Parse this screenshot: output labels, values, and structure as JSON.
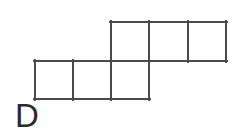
{
  "figure": {
    "label": "D",
    "type": "polyomino-net",
    "background_color": "#ffffff",
    "stroke_color": "#4a4a4a",
    "fill_color": "#ffffff",
    "stroke_width": 2,
    "cell_size": 38,
    "rows": [
      {
        "name": "top-row",
        "y_top": 22,
        "y_bottom": 61,
        "x_start": 111,
        "cells": [
          {
            "name": "cell-top-1",
            "x": 111,
            "y": 22,
            "w": 38,
            "h": 39
          },
          {
            "name": "cell-top-2",
            "x": 149,
            "y": 22,
            "w": 39,
            "h": 39
          },
          {
            "name": "cell-top-3",
            "x": 188,
            "y": 22,
            "w": 38,
            "h": 39
          }
        ]
      },
      {
        "name": "bottom-row",
        "y_top": 61,
        "y_bottom": 99,
        "x_start": 35,
        "cells": [
          {
            "name": "cell-bottom-1",
            "x": 35,
            "y": 61,
            "w": 38,
            "h": 38
          },
          {
            "name": "cell-bottom-2",
            "x": 73,
            "y": 61,
            "w": 38,
            "h": 38
          },
          {
            "name": "cell-bottom-3",
            "x": 111,
            "y": 61,
            "w": 38,
            "h": 38
          }
        ]
      }
    ],
    "vertical_grid_lines": [
      {
        "name": "vline-top-1",
        "x": 111,
        "y1": 22,
        "y2": 61
      },
      {
        "name": "vline-top-2",
        "x": 149,
        "y1": 22,
        "y2": 61
      },
      {
        "name": "vline-top-3",
        "x": 188,
        "y1": 22,
        "y2": 61
      },
      {
        "name": "vline-top-4",
        "x": 226,
        "y1": 22,
        "y2": 61
      },
      {
        "name": "vline-bottom-1",
        "x": 35,
        "y1": 61,
        "y2": 99
      },
      {
        "name": "vline-bottom-2",
        "x": 73,
        "y1": 61,
        "y2": 99
      },
      {
        "name": "vline-bottom-3",
        "x": 111,
        "y1": 61,
        "y2": 99
      },
      {
        "name": "vline-bottom-4",
        "x": 149,
        "y1": 61,
        "y2": 99
      }
    ],
    "horizontal_grid_lines": [
      {
        "name": "hline-top-edge",
        "y": 22,
        "x1": 111,
        "x2": 226
      },
      {
        "name": "hline-middle",
        "y": 61,
        "x1": 35,
        "x2": 226
      },
      {
        "name": "hline-bottom-edge",
        "y": 99,
        "x1": 35,
        "x2": 149
      }
    ]
  }
}
